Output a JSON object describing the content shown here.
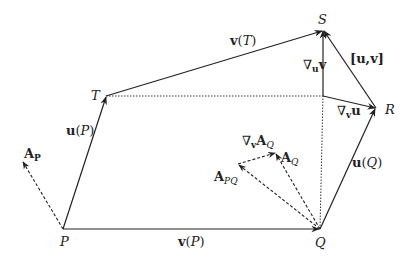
{
  "diagram": {
    "title": "",
    "colors": {
      "line": "#222222",
      "background": "#ffffff"
    },
    "points": {
      "P": {
        "label": "P",
        "x": 63,
        "y": 229
      },
      "Q": {
        "label": "Q",
        "x": 320,
        "y": 229
      },
      "T": {
        "label": "T",
        "x": 106,
        "y": 96
      },
      "S": {
        "label": "S",
        "x": 323,
        "y": 30
      },
      "R": {
        "label": "R",
        "x": 376,
        "y": 108
      },
      "C": {
        "label": "",
        "x": 323,
        "y": 96
      }
    },
    "labels": {
      "P": "P",
      "Q": "Q",
      "T": "T",
      "S": "S",
      "R": "R",
      "uP_bold": "u",
      "uP_arg": "(P)",
      "uP_argvar": "P",
      "vP_bold": "v",
      "vP_argvar": "P",
      "vT_bold": "v",
      "vT_argvar": "T",
      "uQ_bold": "u",
      "uQ_argvar": "Q",
      "nabla": "∇",
      "nabla_u_v_sub": "u",
      "nabla_u_v_main": "v",
      "nabla_v_u_sub": "v",
      "nabla_v_u_main": "u",
      "bracket": "[u,v]",
      "AP_main": "A",
      "AP_sub": "P",
      "APQ_main": "A",
      "APQ_sub": "PQ",
      "AQ_main": "A",
      "AQ_sub": "Q",
      "nablaAQ_sub": "v",
      "nablaAQ_main": "A",
      "nablaAQ_sub2": "Q",
      "open_paren": "(",
      "close_paren": ")"
    },
    "vectors": [
      {
        "name": "u(P)",
        "from": "P",
        "to": "T",
        "style": "solid"
      },
      {
        "name": "v(P)",
        "from": "P",
        "to": "Q",
        "style": "solid"
      },
      {
        "name": "v(T)",
        "from": "T",
        "to": "S",
        "style": "solid"
      },
      {
        "name": "u(Q)",
        "from": "Q",
        "to": "R",
        "style": "solid"
      },
      {
        "name": "nabla_u v",
        "from": "C",
        "to": "S",
        "style": "solid"
      },
      {
        "name": "nabla_v u",
        "from": "C",
        "to": "R",
        "style": "solid"
      },
      {
        "name": "[u,v]",
        "from": "R",
        "to": "S",
        "style": "solid"
      },
      {
        "name": "A_P",
        "from": "P",
        "to": [
          22,
          161
        ],
        "style": "dashed"
      },
      {
        "name": "A_PQ",
        "from": "Q",
        "to": [
          238,
          164
        ],
        "style": "dashed"
      },
      {
        "name": "A_Q",
        "from": "Q",
        "to": [
          276,
          153
        ],
        "style": "dashed"
      },
      {
        "name": "nabla_v A_Q",
        "from": [
          238,
          164
        ],
        "to": [
          276,
          153
        ],
        "style": "dashed"
      }
    ],
    "dotted_lines": [
      {
        "from": "T",
        "to": "C"
      },
      {
        "from": "Q",
        "to": "C"
      }
    ]
  }
}
